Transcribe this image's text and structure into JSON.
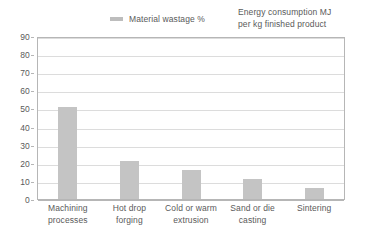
{
  "chart_data": {
    "type": "bar",
    "title": "",
    "subtitle": "",
    "xlabel": "",
    "ylabel": "",
    "ylim": [
      0,
      90
    ],
    "ytick_step": 10,
    "yticks": [
      0,
      10,
      20,
      30,
      40,
      50,
      60,
      70,
      80,
      90
    ],
    "grid": true,
    "legend_position": "top",
    "categories": [
      "Machining processes",
      "Hot drop forging",
      "Cold or warm extrusion",
      "Sand or die casting",
      "Sintering"
    ],
    "category_lines": [
      [
        "Machining",
        "processes"
      ],
      [
        "Hot drop",
        "forging"
      ],
      [
        "Cold or warm",
        "extrusion"
      ],
      [
        "Sand or die",
        "casting"
      ],
      [
        "Sintering",
        ""
      ]
    ],
    "series": [
      {
        "name": "Material wastage %",
        "values": [
          51,
          21,
          16,
          11,
          6
        ],
        "color": "#c4c4c4"
      }
    ],
    "legend_entries": [
      {
        "label": "Material wastage %",
        "has_swatch": true,
        "swatch_color": "#bdbdbd"
      },
      {
        "label": "Energy consumption MJ per kg finished product",
        "has_swatch": false,
        "swatch_color": ""
      }
    ],
    "annotations": [
      "Energy consumption MJ",
      "per kg finished product"
    ]
  },
  "legend": {
    "wastage_label": "Material wastage %",
    "energy_line_1": "Energy consumption MJ",
    "energy_line_2": "per kg finished product"
  },
  "axis": {
    "y_ticks": [
      "90",
      "80",
      "70",
      "60",
      "50",
      "40",
      "30",
      "20",
      "10",
      "0"
    ]
  },
  "colors": {
    "bar_fill": "#c4c4c4",
    "bar_stroke": "#bcbcbc",
    "gridline": "#dcdcdc",
    "border": "#b6b6b6",
    "text": "#5a5a5a",
    "background": "#ffffff"
  }
}
